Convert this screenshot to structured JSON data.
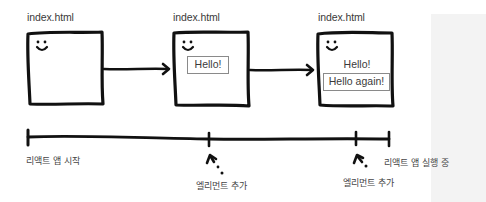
{
  "diagram": {
    "frames": [
      {
        "file_label": "index.html",
        "elements": []
      },
      {
        "file_label": "index.html",
        "elements": [
          {
            "text": "Hello!",
            "boxed": true
          }
        ]
      },
      {
        "file_label": "index.html",
        "elements": [
          {
            "text": "Hello!",
            "boxed": false
          },
          {
            "text": "Hello again!",
            "boxed": true
          }
        ]
      }
    ],
    "timeline": {
      "start_label": "리액트 앱 시작",
      "end_label": "리액트 앱 실행 중",
      "events": [
        {
          "label": "엘리먼트 추가"
        },
        {
          "label": "엘리먼트 추가"
        }
      ]
    },
    "colors": {
      "stroke": "#111111",
      "text": "#3a3a3a",
      "element_border": "#8a8a8a",
      "side_panel": "#f3f3f3"
    }
  }
}
